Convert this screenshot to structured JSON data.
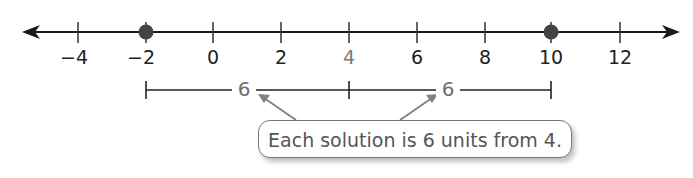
{
  "diagram": {
    "type": "number-line",
    "axis": {
      "min_visible": -5.5,
      "max_visible": 13.5,
      "arrows": [
        "left",
        "right"
      ],
      "ticks": [
        -4,
        -2,
        0,
        2,
        4,
        6,
        8,
        10,
        12
      ],
      "tick_labels": [
        "−4",
        "−2",
        "0",
        "2",
        "4",
        "6",
        "8",
        "10",
        "12"
      ],
      "highlighted_tick": "4"
    },
    "points": [
      {
        "value": -2,
        "style": "closed-dot"
      },
      {
        "value": 10,
        "style": "closed-dot"
      }
    ],
    "segments": [
      {
        "from": -2,
        "to": 4,
        "label": "6"
      },
      {
        "from": 4,
        "to": 10,
        "label": "6"
      }
    ],
    "callout": {
      "text": "Each solution is 6 units from 4.",
      "points_to": [
        "left-segment-label",
        "right-segment-label"
      ]
    },
    "colors": {
      "line": "#1a1a1a",
      "dot": "#444444",
      "gray_text": "#6e6e6e",
      "arrow": "#808080"
    }
  }
}
